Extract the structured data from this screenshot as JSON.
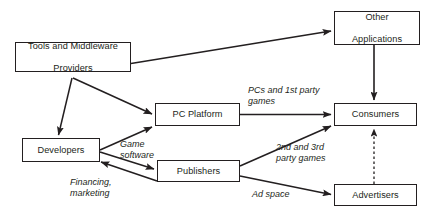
{
  "diagram": {
    "type": "flow-diagram",
    "stroke_color": "#231f20",
    "background_color": "#ffffff",
    "nodes": [
      {
        "id": "tools",
        "label": "Tools and Middleware\nProviders",
        "line1": "Tools and Middleware",
        "line2": "Providers"
      },
      {
        "id": "other_apps",
        "label": "Other\nApplications",
        "line1": "Other",
        "line2": "Applications"
      },
      {
        "id": "pc_platform",
        "label": "PC Platform",
        "line1": "PC Platform",
        "line2": ""
      },
      {
        "id": "consumers",
        "label": "Consumers",
        "line1": "Consumers",
        "line2": ""
      },
      {
        "id": "developers",
        "label": "Developers",
        "line1": "Developers",
        "line2": ""
      },
      {
        "id": "publishers",
        "label": "Publishers",
        "line1": "Publishers",
        "line2": ""
      },
      {
        "id": "advertisers",
        "label": "Advertisers",
        "line1": "Advertisers",
        "line2": ""
      }
    ],
    "edge_labels": [
      {
        "id": "pcs_1st_party",
        "text": "PCs and 1st party\ngames"
      },
      {
        "id": "game_software",
        "text": "Game\nsoftware"
      },
      {
        "id": "financing",
        "text": "Financing,\nmarketing"
      },
      {
        "id": "2nd_3rd_party",
        "text": "2nd and 3rd\nparty games"
      },
      {
        "id": "ad_space",
        "text": "Ad space"
      }
    ],
    "edges": [
      {
        "id": "tools-to-other-apps",
        "from": "tools",
        "to": "other_apps",
        "style": "solid",
        "label": ""
      },
      {
        "id": "tools-to-developers",
        "from": "tools",
        "to": "developers",
        "style": "solid",
        "label": ""
      },
      {
        "id": "tools-to-pc-platform",
        "from": "tools",
        "to": "pc_platform",
        "style": "solid",
        "label": ""
      },
      {
        "id": "developers-to-pc-platform",
        "from": "developers",
        "to": "pc_platform",
        "style": "solid",
        "label": ""
      },
      {
        "id": "developers-to-publishers",
        "from": "developers",
        "to": "publishers",
        "style": "solid",
        "label": "Game software"
      },
      {
        "id": "publishers-to-developers",
        "from": "publishers",
        "to": "developers",
        "style": "solid",
        "label": "Financing, marketing"
      },
      {
        "id": "pc-platform-to-consumers",
        "from": "pc_platform",
        "to": "consumers",
        "style": "solid",
        "label": "PCs and 1st party games"
      },
      {
        "id": "publishers-to-consumers",
        "from": "publishers",
        "to": "consumers",
        "style": "solid",
        "label": "2nd and 3rd party games"
      },
      {
        "id": "publishers-to-advertisers",
        "from": "publishers",
        "to": "advertisers",
        "style": "solid",
        "label": "Ad space"
      },
      {
        "id": "other-apps-to-consumers",
        "from": "other_apps",
        "to": "consumers",
        "style": "solid",
        "label": ""
      },
      {
        "id": "advertisers-to-consumers",
        "from": "advertisers",
        "to": "consumers",
        "style": "dashed",
        "label": ""
      }
    ]
  }
}
